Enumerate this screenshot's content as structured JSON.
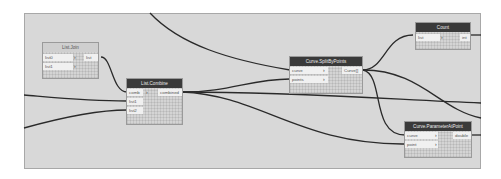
{
  "canvas": {
    "background": "#d8d8d8",
    "border": "#a8a8a8"
  },
  "nodes": {
    "list_join": {
      "title": "List.Join",
      "inputs": [
        "list0",
        "list1"
      ],
      "output": "list",
      "lacing_marks": [
        "›",
        "›"
      ]
    },
    "list_combine": {
      "title": "List.Combine",
      "inputs": [
        "comb",
        "list1",
        "list2"
      ],
      "output": "combined",
      "lacing_marks": [
        "›"
      ]
    },
    "curve_split": {
      "title": "Curve.SplitByPoints",
      "inputs": [
        "curve",
        "points"
      ],
      "output": "Curve[]",
      "lacing_marks": [
        "›",
        "›"
      ]
    },
    "count": {
      "title": "Count",
      "inputs": [
        "list"
      ],
      "output": "int",
      "lacing_marks": [
        "›"
      ]
    },
    "curve_param": {
      "title": "Curve.ParameterAtPoint",
      "inputs": [
        "curve",
        "point"
      ],
      "output": "double",
      "lacing_marks": [
        "›",
        "›"
      ]
    }
  },
  "wire_color": "#2a2a2a"
}
